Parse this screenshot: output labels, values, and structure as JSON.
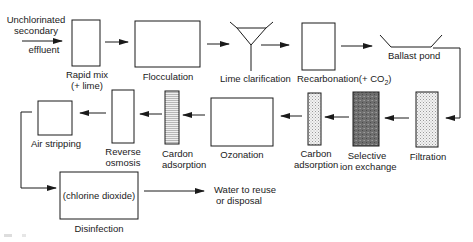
{
  "diagram": {
    "type": "process-flow",
    "input": {
      "label_line1": "Unchlorinated",
      "label_line2": "secondary",
      "label_line3": "effluent"
    },
    "steps": [
      {
        "id": "rapid-mix",
        "label_line1": "Rapid mix",
        "label_line2": "(+ lime)"
      },
      {
        "id": "flocculation",
        "label_line1": "Flocculation"
      },
      {
        "id": "lime-clarification",
        "label_line1": "Lime clarification"
      },
      {
        "id": "recarbonation",
        "label_line1": "Recarbonation(+ CO",
        "label_sub": "2",
        "label_tail": ")"
      },
      {
        "id": "ballast-pond",
        "label_line1": "Ballast pond"
      },
      {
        "id": "filtration",
        "label_line1": "Filtration"
      },
      {
        "id": "selective-ion-exchange",
        "label_line1": "Selective",
        "label_line2": "ion exchange"
      },
      {
        "id": "carbon-adsorption-1",
        "label_line1": "Carbon",
        "label_line2": "adsorption"
      },
      {
        "id": "ozonation",
        "label_line1": "Ozonation"
      },
      {
        "id": "carbon-adsorption-2",
        "label_line1": "Cardon",
        "label_line2": "adsorption"
      },
      {
        "id": "reverse-osmosis",
        "label_line1": "Reverse",
        "label_line2": "osmosis"
      },
      {
        "id": "air-stripping",
        "label_line1": "Air stripping"
      },
      {
        "id": "disinfection",
        "label_line1": "Disinfection",
        "inner_text": "(chlorine dioxide)"
      }
    ],
    "output": {
      "label_line1": "Water to reuse",
      "label_line2": "or disposal"
    },
    "colors": {
      "stroke": "#1a1a1a",
      "light_fill": "#e8e8e8",
      "dark_fill": "#6a6a6a"
    }
  }
}
